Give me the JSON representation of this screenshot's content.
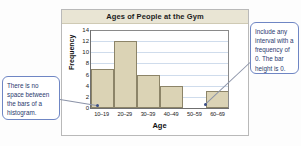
{
  "figure": {
    "kind": "textbook-histogram-with-annotations"
  },
  "chart_panel": {
    "title": "Ages of People at the Gym"
  },
  "annotations": [
    {
      "id": "no-space-between-bars",
      "text": "There is no space between the bars of a histogram.",
      "points_to": "bar-gap-between-10-19-and-20-29"
    },
    {
      "id": "zero-frequency-interval",
      "text": "Include any interval with a frequency of 0. The bar height is 0.",
      "points_to": "bar-50-59"
    }
  ],
  "chart_data": {
    "type": "bar",
    "title": "Ages of People at the Gym",
    "xlabel": "Age",
    "ylabel": "Frequency",
    "categories": [
      "10–19",
      "20–29",
      "30–39",
      "40–49",
      "50–59",
      "60–69"
    ],
    "values": [
      7,
      12,
      6,
      4,
      0,
      3
    ],
    "ylim": [
      0,
      14
    ],
    "yticks": [
      0,
      2,
      4,
      6,
      8,
      10,
      12,
      14
    ],
    "grid": true,
    "legend": null,
    "bar_gap": 0,
    "colors": {
      "bar_fill": "#dbd3b5",
      "bar_edge": "#8c8468",
      "gridline": "#cfdcec",
      "axis": "#6f6f6f",
      "title_band": "#e9e5d4",
      "callout_border": "#6f86c4",
      "callout_text": "#2a3a6e"
    }
  }
}
